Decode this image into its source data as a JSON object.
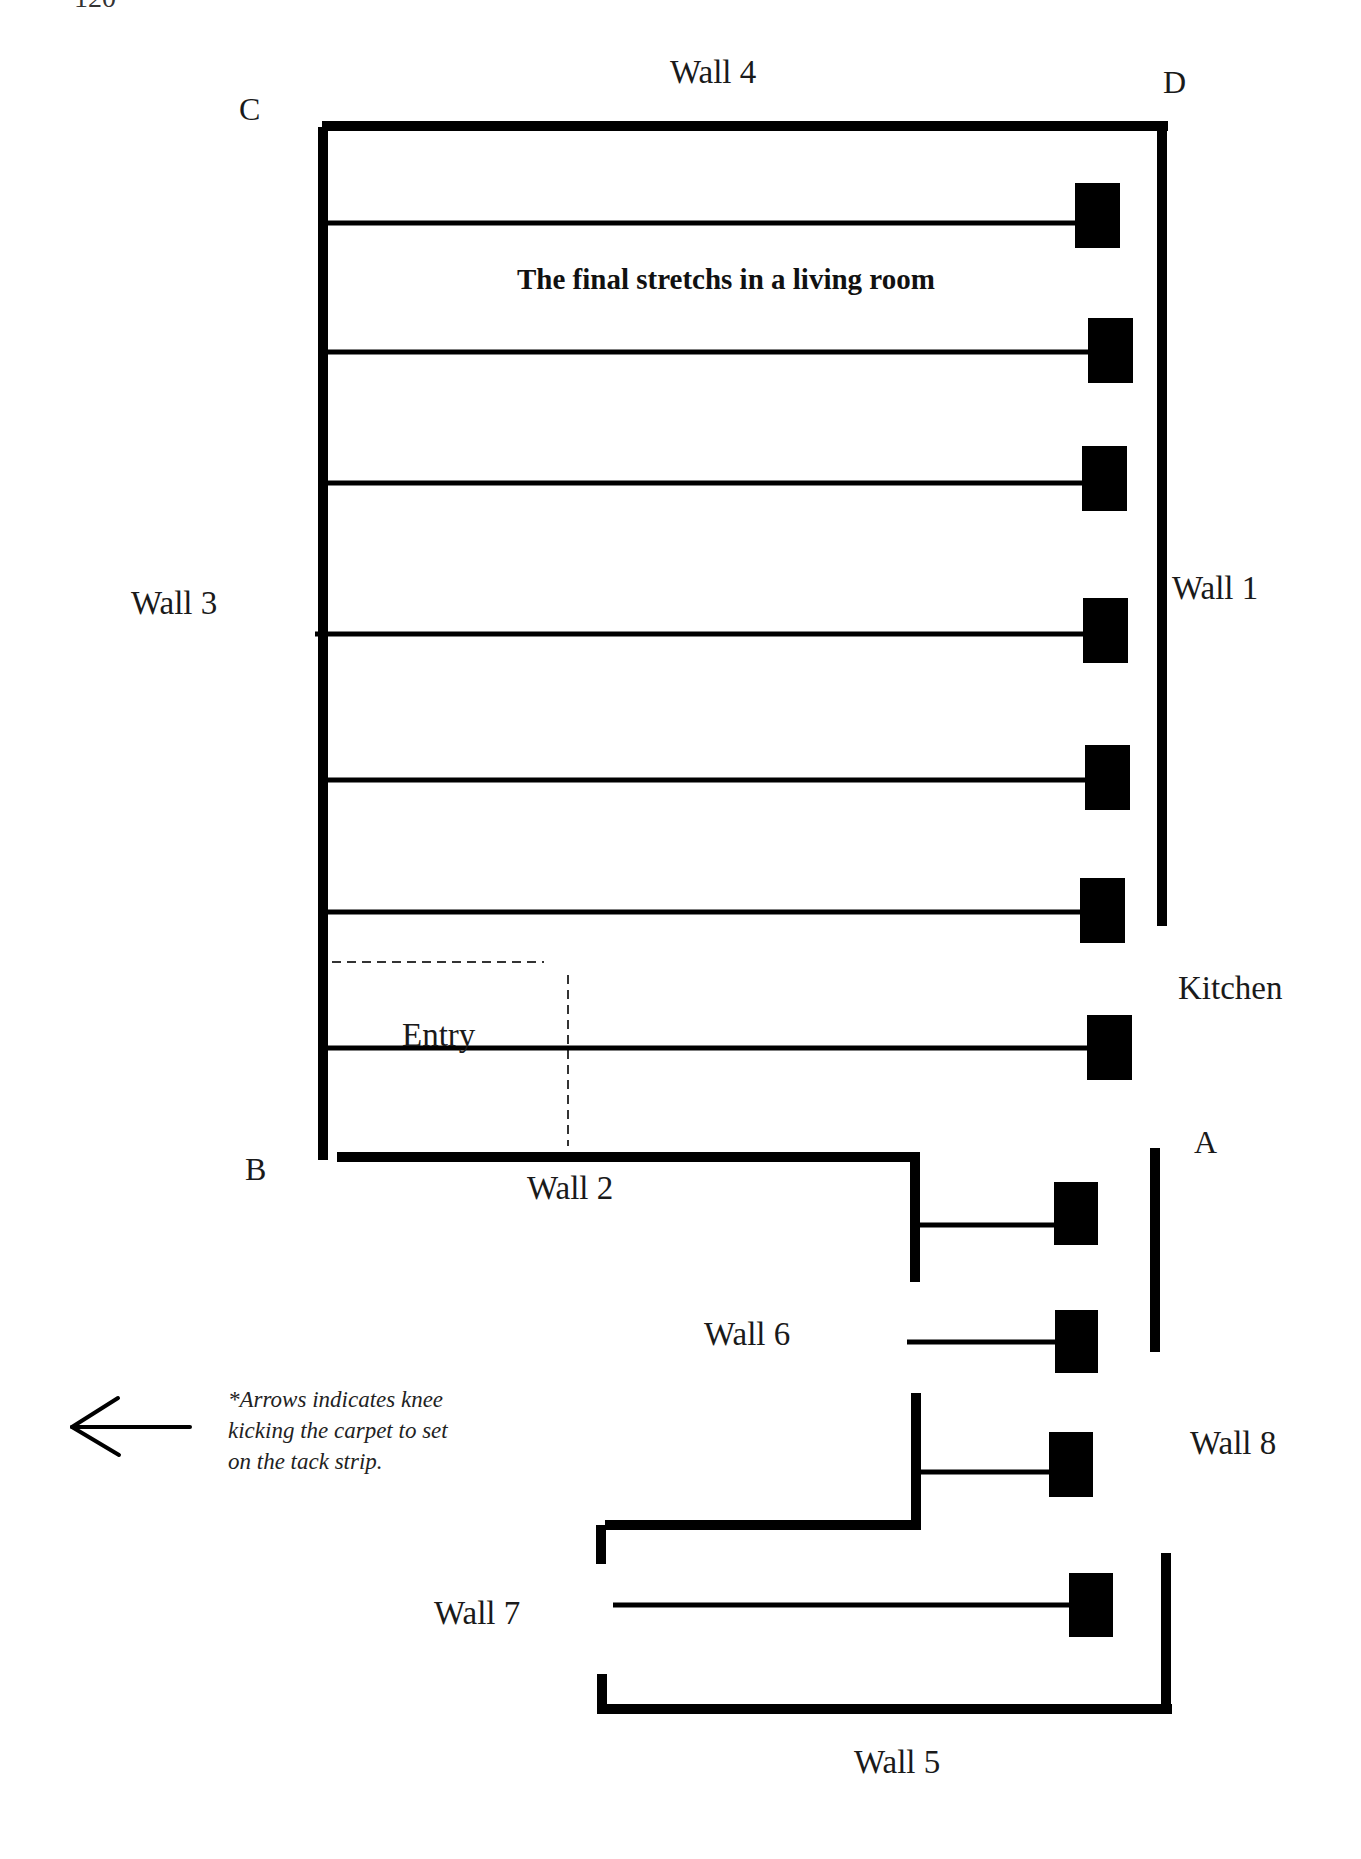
{
  "page": {
    "page_number": "120"
  },
  "diagram": {
    "title": "The final stretchs in a living room",
    "corners": {
      "A": "A",
      "B": "B",
      "C": "C",
      "D": "D"
    },
    "walls": {
      "wall1": "Wall 1",
      "wall2": "Wall 2",
      "wall3": "Wall 3",
      "wall4": "Wall 4",
      "wall5": "Wall 5",
      "wall6": "Wall 6",
      "wall7": "Wall 7",
      "wall8": "Wall 8"
    },
    "areas": {
      "kitchen": "Kitchen",
      "entry": "Entry"
    },
    "legend": {
      "arrow_icon": "left-arrow-icon",
      "note": "*Arrows indicates knee\nkicking the carpet to set\non the tack strip."
    },
    "stretches": [
      {
        "from_x": 318,
        "to_x": 1075,
        "y": 223,
        "block": {
          "x": 1075,
          "y": 183,
          "w": 45,
          "h": 65
        }
      },
      {
        "from_x": 320,
        "to_x": 1088,
        "y": 352,
        "block": {
          "x": 1088,
          "y": 318,
          "w": 45,
          "h": 65
        }
      },
      {
        "from_x": 320,
        "to_x": 1082,
        "y": 483,
        "block": {
          "x": 1082,
          "y": 446,
          "w": 45,
          "h": 65
        }
      },
      {
        "from_x": 315,
        "to_x": 1083,
        "y": 634,
        "block": {
          "x": 1083,
          "y": 598,
          "w": 45,
          "h": 65
        }
      },
      {
        "from_x": 322,
        "to_x": 1085,
        "y": 780,
        "block": {
          "x": 1085,
          "y": 745,
          "w": 45,
          "h": 65
        }
      },
      {
        "from_x": 318,
        "to_x": 1080,
        "y": 912,
        "block": {
          "x": 1080,
          "y": 878,
          "w": 45,
          "h": 65
        }
      },
      {
        "from_x": 328,
        "to_x": 1087,
        "y": 1048,
        "block": {
          "x": 1087,
          "y": 1015,
          "w": 45,
          "h": 65
        }
      },
      {
        "from_x": 920,
        "to_x": 1054,
        "y": 1225,
        "block": {
          "x": 1054,
          "y": 1182,
          "w": 44,
          "h": 63
        }
      },
      {
        "from_x": 907,
        "to_x": 1055,
        "y": 1342,
        "block": {
          "x": 1055,
          "y": 1310,
          "w": 43,
          "h": 63
        }
      },
      {
        "from_x": 921,
        "to_x": 1049,
        "y": 1472,
        "block": {
          "x": 1049,
          "y": 1432,
          "w": 44,
          "h": 65
        }
      },
      {
        "from_x": 613,
        "to_x": 1069,
        "y": 1605,
        "block": {
          "x": 1069,
          "y": 1573,
          "w": 44,
          "h": 64
        }
      }
    ],
    "colors": {
      "ink": "#000000",
      "paper": "#ffffff",
      "text": "#1a1a1a"
    }
  }
}
